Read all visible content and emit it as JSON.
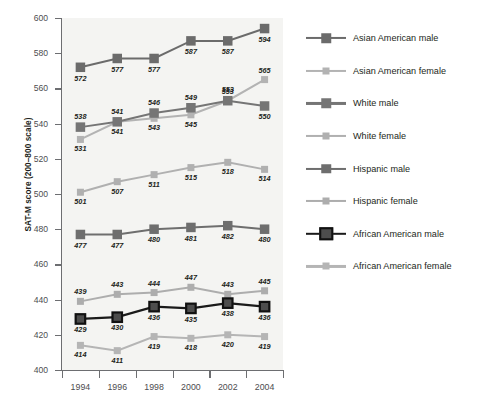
{
  "chart_data": {
    "type": "line",
    "title": "",
    "xlabel": "",
    "ylabel": "SAT-M score (200–800 scale)",
    "categories": [
      "1994",
      "1996",
      "1998",
      "2000",
      "2002",
      "2004"
    ],
    "x": [
      1994,
      1996,
      1998,
      2000,
      2002,
      2004
    ],
    "ylim": [
      400,
      600
    ],
    "yticks": [
      400,
      420,
      440,
      460,
      480,
      500,
      520,
      540,
      560,
      580,
      600
    ],
    "grid": false,
    "legend_position": "right",
    "data_labels": true,
    "series": [
      {
        "name": "Asian American male",
        "color": "#6b6b6b",
        "marker": "square-large",
        "values": [
          572,
          577,
          577,
          587,
          587,
          594
        ],
        "label_side": [
          "below",
          "below",
          "below",
          "below",
          "below",
          "below"
        ]
      },
      {
        "name": "Asian American female",
        "color": "#b3b3b3",
        "marker": "square-small",
        "values": [
          531,
          541,
          543,
          545,
          553,
          565
        ],
        "label_side": [
          "below",
          "below",
          "below",
          "below",
          "above",
          "above"
        ]
      },
      {
        "name": "White male",
        "color": "#757575",
        "marker": "square-large",
        "values": [
          538,
          541,
          546,
          549,
          553,
          550
        ],
        "label_side": [
          "above",
          "above",
          "above",
          "above",
          "above",
          "below"
        ]
      },
      {
        "name": "White female",
        "color": "#b0b0b0",
        "marker": "square-small",
        "values": [
          501,
          507,
          511,
          515,
          518,
          514
        ],
        "label_side": [
          "below",
          "below",
          "below",
          "below",
          "below",
          "below"
        ]
      },
      {
        "name": "Hispanic male",
        "color": "#6e6e6e",
        "marker": "square-large",
        "values": [
          477,
          477,
          480,
          481,
          482,
          480
        ],
        "label_side": [
          "below",
          "below",
          "below",
          "below",
          "below",
          "below"
        ]
      },
      {
        "name": "Hispanic female",
        "color": "#adadad",
        "marker": "square-small",
        "values": [
          439,
          443,
          444,
          447,
          443,
          445
        ],
        "label_side": [
          "above",
          "above",
          "above",
          "above",
          "above",
          "above"
        ]
      },
      {
        "name": "African American male",
        "color": "#1a1a1a",
        "marker": "square-outline",
        "values": [
          429,
          430,
          436,
          435,
          438,
          436
        ],
        "label_side": [
          "below",
          "below",
          "below",
          "below",
          "below",
          "below"
        ]
      },
      {
        "name": "African American female",
        "color": "#b5b5b5",
        "marker": "square-small",
        "values": [
          414,
          411,
          419,
          418,
          420,
          419
        ],
        "label_side": [
          "below",
          "below",
          "below",
          "below",
          "below",
          "below"
        ]
      }
    ]
  },
  "legend": {
    "items": [
      "Asian American male",
      "Asian American female",
      "White male",
      "White female",
      "Hispanic male",
      "Hispanic female",
      "African American male",
      "African American female"
    ]
  },
  "axis": {
    "y_title": "SAT-M score (200–800 scale)",
    "y_tick_labels": [
      "600",
      "580",
      "560",
      "540",
      "520",
      "500",
      "480",
      "460",
      "440",
      "420",
      "400"
    ],
    "x_tick_labels": [
      "1994",
      "1996",
      "1998",
      "2000",
      "2002",
      "2004"
    ]
  }
}
